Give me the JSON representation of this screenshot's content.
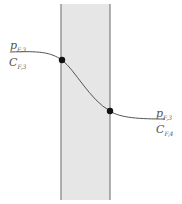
{
  "diagram": {
    "membrane_fill": "#e6e6e6",
    "membrane_edge": "#888888",
    "curve_color": "#555555",
    "left": {
      "p_main": "p",
      "p_sub": "F,3",
      "c_main": "C",
      "c_sub": "F,3"
    },
    "right": {
      "p_main": "p",
      "p_sub": "F,3",
      "c_main": "C",
      "c_sub": "F,4"
    }
  }
}
